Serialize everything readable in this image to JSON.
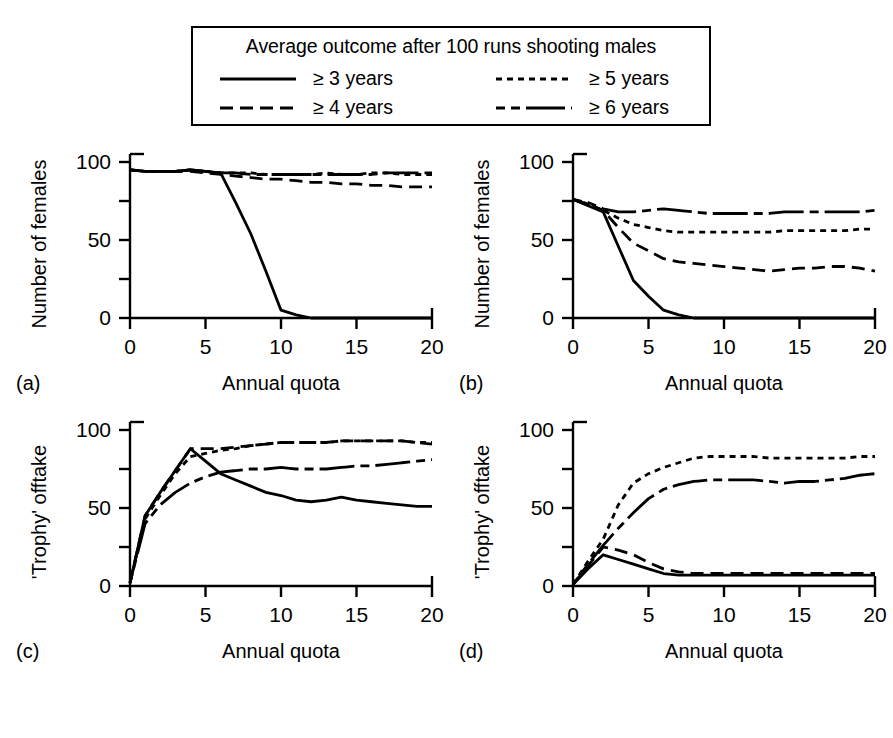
{
  "legend": {
    "title": "Average outcome after 100 runs shooting males",
    "entries": [
      {
        "label": "≥ 3 years",
        "style": "solid",
        "key": "ge3"
      },
      {
        "label": "≥ 5 years",
        "style": "dotted",
        "key": "ge5"
      },
      {
        "label": "≥ 4 years",
        "style": "dashed",
        "key": "ge4"
      },
      {
        "label": "≥ 6 years",
        "style": "dashdot",
        "key": "ge6"
      }
    ]
  },
  "panels": [
    {
      "letter": "(a)",
      "ylabel": "Number of females",
      "xlabel": "Annual quota"
    },
    {
      "letter": "(b)",
      "ylabel": "Number of females",
      "xlabel": "Annual quota"
    },
    {
      "letter": "(c)",
      "ylabel": "'Trophy' offtake",
      "xlabel": "Annual quota"
    },
    {
      "letter": "(d)",
      "ylabel": "'Trophy' offtake",
      "xlabel": "Annual quota"
    }
  ],
  "axes": {
    "x_ticks": [
      0,
      5,
      10,
      15,
      20
    ],
    "x_tick_labels": [
      "0",
      "5",
      "10",
      "15",
      "20"
    ],
    "y_ticks": [
      0,
      25,
      50,
      75,
      100
    ],
    "y_tick_labels": [
      "0",
      "",
      "50",
      "",
      "100"
    ],
    "xlim": [
      0,
      20
    ],
    "ylim": [
      0,
      100
    ]
  },
  "chart_data": [
    {
      "type": "line",
      "panel": "(a)",
      "title": "",
      "xlabel": "Annual quota",
      "ylabel": "Number of females",
      "xlim": [
        0,
        20
      ],
      "ylim": [
        0,
        100
      ],
      "grid": false,
      "legend_position": "top-external",
      "x": [
        0,
        1,
        2,
        3,
        4,
        5,
        6,
        7,
        8,
        9,
        10,
        11,
        12,
        13,
        14,
        15,
        16,
        17,
        18,
        19,
        20
      ],
      "series": [
        {
          "name": "≥ 3 years",
          "style": "solid",
          "values": [
            95,
            94,
            94,
            94,
            95,
            94,
            93,
            74,
            54,
            30,
            5,
            2,
            0,
            0,
            0,
            0,
            0,
            0,
            0,
            0,
            0
          ]
        },
        {
          "name": "≥ 4 years",
          "style": "dashed",
          "values": [
            95,
            94,
            94,
            94,
            94,
            93,
            92,
            91,
            90,
            89,
            89,
            88,
            87,
            87,
            86,
            86,
            85,
            85,
            84,
            84,
            84
          ]
        },
        {
          "name": "≥ 5 years",
          "style": "dotted",
          "values": [
            95,
            94,
            94,
            94,
            95,
            94,
            93,
            93,
            93,
            92,
            92,
            92,
            92,
            93,
            92,
            92,
            93,
            93,
            92,
            92,
            92
          ]
        },
        {
          "name": "≥ 6 years",
          "style": "dashdot",
          "values": [
            95,
            94,
            94,
            94,
            95,
            94,
            93,
            93,
            92,
            92,
            92,
            92,
            92,
            92,
            92,
            92,
            92,
            93,
            93,
            93,
            93
          ]
        }
      ]
    },
    {
      "type": "line",
      "panel": "(b)",
      "title": "",
      "xlabel": "Annual quota",
      "ylabel": "Number of females",
      "xlim": [
        0,
        20
      ],
      "ylim": [
        0,
        100
      ],
      "grid": false,
      "legend_position": "top-external",
      "x": [
        0,
        1,
        2,
        3,
        4,
        5,
        6,
        7,
        8,
        9,
        10,
        11,
        12,
        13,
        14,
        15,
        16,
        17,
        18,
        19,
        20
      ],
      "series": [
        {
          "name": "≥ 3 years",
          "style": "solid",
          "values": [
            76,
            72,
            68,
            46,
            24,
            14,
            5,
            2,
            0,
            0,
            0,
            0,
            0,
            0,
            0,
            0,
            0,
            0,
            0,
            0,
            0
          ]
        },
        {
          "name": "≥ 4 years",
          "style": "dashed",
          "values": [
            76,
            73,
            69,
            58,
            48,
            43,
            38,
            36,
            35,
            34,
            33,
            32,
            31,
            30,
            31,
            32,
            32,
            33,
            33,
            32,
            30
          ]
        },
        {
          "name": "≥ 5 years",
          "style": "dotted",
          "values": [
            76,
            73,
            69,
            64,
            60,
            58,
            56,
            55,
            55,
            55,
            55,
            55,
            55,
            55,
            56,
            56,
            56,
            56,
            56,
            57,
            57
          ]
        },
        {
          "name": "≥ 6 years",
          "style": "dashdot",
          "values": [
            76,
            74,
            70,
            68,
            68,
            69,
            70,
            69,
            68,
            67,
            67,
            67,
            67,
            67,
            68,
            68,
            68,
            68,
            68,
            68,
            69
          ]
        }
      ]
    },
    {
      "type": "line",
      "panel": "(c)",
      "title": "",
      "xlabel": "Annual quota",
      "ylabel": "'Trophy' offtake",
      "xlim": [
        0,
        20
      ],
      "ylim": [
        0,
        100
      ],
      "grid": false,
      "legend_position": "top-external",
      "x": [
        0,
        1,
        2,
        3,
        4,
        5,
        6,
        7,
        8,
        9,
        10,
        11,
        12,
        13,
        14,
        15,
        16,
        17,
        18,
        19,
        20
      ],
      "series": [
        {
          "name": "≥ 3 years",
          "style": "solid",
          "values": [
            2,
            45,
            60,
            74,
            88,
            80,
            72,
            68,
            64,
            60,
            58,
            55,
            54,
            55,
            57,
            55,
            54,
            53,
            52,
            51,
            51
          ]
        },
        {
          "name": "≥ 4 years",
          "style": "dashed",
          "values": [
            2,
            45,
            60,
            74,
            88,
            88,
            88,
            89,
            90,
            91,
            92,
            92,
            92,
            92,
            93,
            93,
            93,
            93,
            93,
            92,
            91
          ]
        },
        {
          "name": "≥ 5 years",
          "style": "dotted",
          "values": [
            2,
            43,
            58,
            72,
            83,
            85,
            87,
            88,
            90,
            91,
            92,
            92,
            92,
            92,
            93,
            93,
            93,
            93,
            93,
            92,
            92
          ]
        },
        {
          "name": "≥ 6 years",
          "style": "dashdot",
          "values": [
            2,
            40,
            52,
            60,
            66,
            70,
            73,
            74,
            75,
            75,
            76,
            75,
            75,
            75,
            76,
            77,
            77,
            78,
            79,
            80,
            81
          ]
        }
      ]
    },
    {
      "type": "line",
      "panel": "(d)",
      "title": "",
      "xlabel": "Annual quota",
      "ylabel": "'Trophy' offtake",
      "xlim": [
        0,
        20
      ],
      "ylim": [
        0,
        100
      ],
      "grid": false,
      "legend_position": "top-external",
      "x": [
        0,
        1,
        2,
        3,
        4,
        5,
        6,
        7,
        8,
        9,
        10,
        11,
        12,
        13,
        14,
        15,
        16,
        17,
        18,
        19,
        20
      ],
      "series": [
        {
          "name": "≥ 3 years",
          "style": "solid",
          "values": [
            1,
            11,
            20,
            17,
            14,
            11,
            8,
            7,
            7,
            7,
            7,
            7,
            7,
            7,
            7,
            7,
            7,
            7,
            7,
            7,
            7
          ]
        },
        {
          "name": "≥ 4 years",
          "style": "dashed",
          "values": [
            1,
            13,
            25,
            23,
            20,
            15,
            11,
            9,
            8,
            8,
            8,
            8,
            8,
            8,
            8,
            8,
            8,
            8,
            8,
            8,
            8
          ]
        },
        {
          "name": "≥ 5 years",
          "style": "dotted",
          "values": [
            1,
            16,
            30,
            52,
            66,
            72,
            76,
            79,
            82,
            83,
            83,
            83,
            83,
            82,
            82,
            82,
            82,
            82,
            82,
            83,
            83
          ]
        },
        {
          "name": "≥ 6 years",
          "style": "dashdot",
          "values": [
            1,
            14,
            26,
            37,
            47,
            56,
            62,
            65,
            67,
            68,
            68,
            68,
            68,
            67,
            66,
            67,
            67,
            68,
            69,
            71,
            72
          ]
        }
      ]
    }
  ]
}
